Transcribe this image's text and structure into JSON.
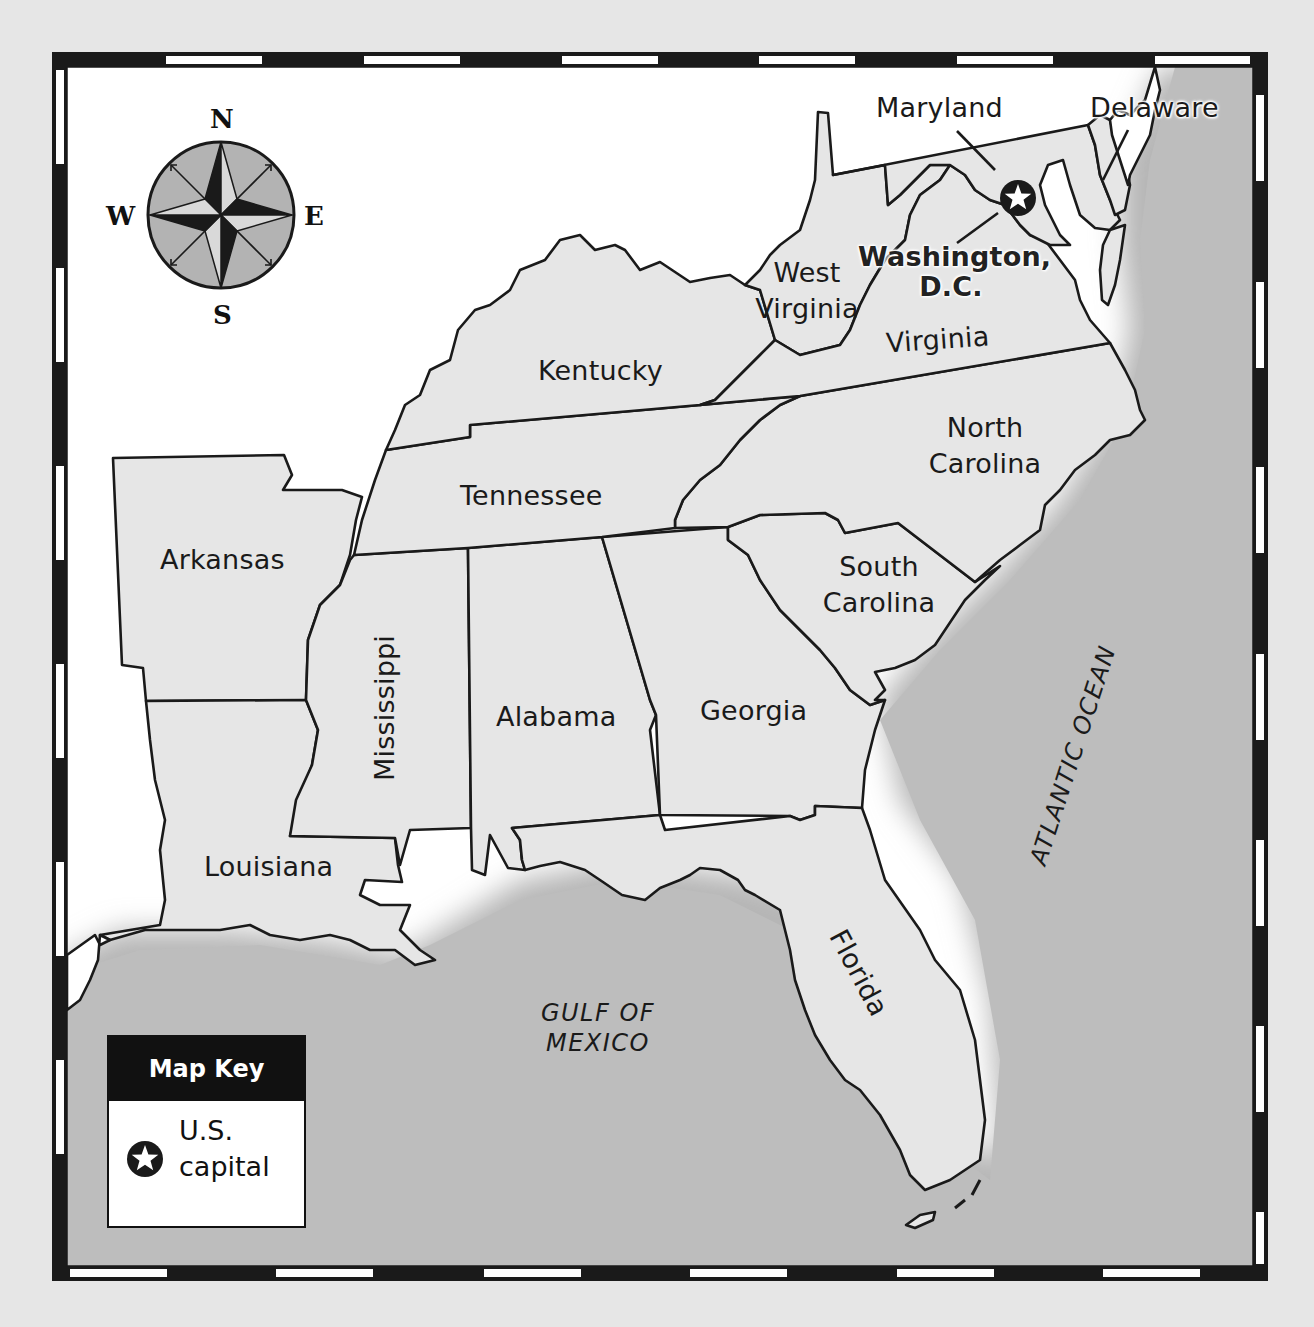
{
  "map": {
    "type": "political map",
    "region": "Southeastern United States",
    "colors": {
      "land": "#e6e6e6",
      "water": "#b9b9b9",
      "outside": "#ffffff",
      "outline": "#1a1a1a",
      "border_dark": "#1a1a1a",
      "border_light": "#ffffff"
    }
  },
  "compass": {
    "icon": "compass-rose-icon",
    "n": "N",
    "e": "E",
    "s": "S",
    "w": "W"
  },
  "states": {
    "maryland": "Maryland",
    "delaware": "Delaware",
    "west_virginia_1": "West",
    "west_virginia_2": "Virginia",
    "virginia": "Virginia",
    "kentucky": "Kentucky",
    "tennessee": "Tennessee",
    "north_carolina_1": "North",
    "north_carolina_2": "Carolina",
    "south_carolina_1": "South",
    "south_carolina_2": "Carolina",
    "arkansas": "Arkansas",
    "mississippi": "Mississippi",
    "alabama": "Alabama",
    "georgia": "Georgia",
    "louisiana": "Louisiana",
    "florida": "Florida"
  },
  "capital": {
    "label_1": "Washington,",
    "label_2": "D.C.",
    "icon": "star-in-circle-icon"
  },
  "water_bodies": {
    "atlantic": "ATLANTIC OCEAN",
    "gulf_1": "GULF OF",
    "gulf_2": "MEXICO"
  },
  "map_key": {
    "title": "Map Key",
    "items": [
      {
        "icon": "star-in-circle-icon",
        "label_1": "U.S.",
        "label_2": "capital"
      }
    ]
  }
}
